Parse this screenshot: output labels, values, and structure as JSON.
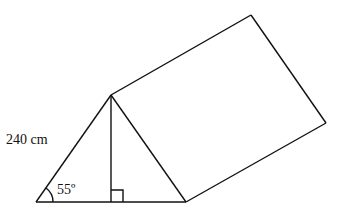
{
  "diagram": {
    "type": "triangular-prism",
    "labels": {
      "slant_side": "240 cm",
      "angle": "55º"
    },
    "stroke_color": "#111111",
    "points": {
      "apex": [
        111,
        95
      ],
      "base_left": [
        36,
        202
      ],
      "base_right": [
        186,
        202
      ],
      "foot": [
        111,
        202
      ],
      "top_back": [
        251,
        15
      ],
      "right_back": [
        326,
        123
      ]
    }
  }
}
